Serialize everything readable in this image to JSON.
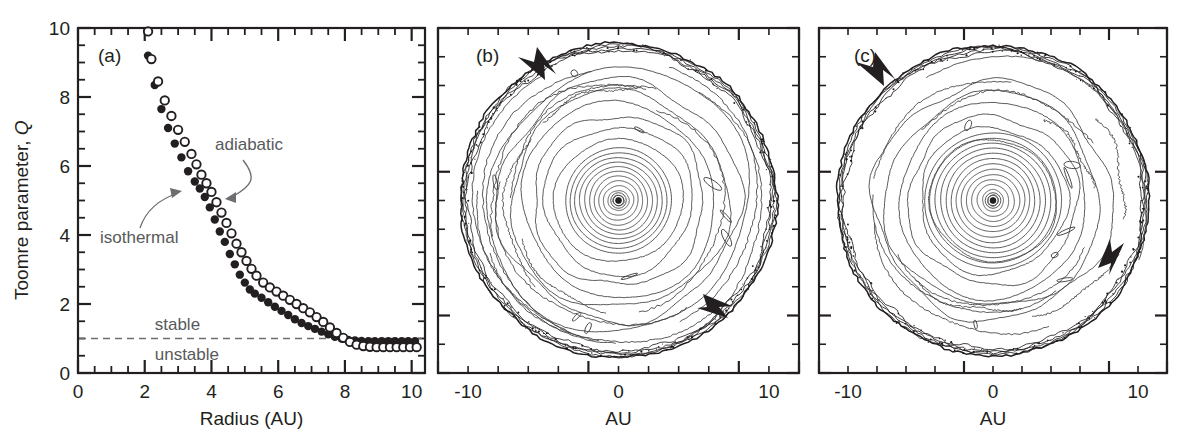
{
  "figure": {
    "background": "#ffffff",
    "ink": "#231f20",
    "annotation_color": "#58595b"
  },
  "panel_a": {
    "label": "(a)",
    "xlabel": "Radius (AU)",
    "ylabel_main": "Toomre parameter, ",
    "ylabel_symbol": "Q",
    "xticklabels": [
      "0",
      "2",
      "4",
      "6",
      "8",
      "10"
    ],
    "yticklabels": [
      "0",
      "2",
      "4",
      "6",
      "8",
      "10"
    ],
    "annotations": [
      {
        "name": "adiabatic",
        "text": "adiabatic"
      },
      {
        "name": "isothermal",
        "text": "isothermal"
      }
    ],
    "region_labels": [
      {
        "name": "stable",
        "text": "stable"
      },
      {
        "name": "unstable",
        "text": "unstable"
      }
    ],
    "threshold_label_value": "1"
  },
  "panel_b": {
    "label": "(b)",
    "xlabel": "AU",
    "xticklabels": [
      "-10",
      "0",
      "10"
    ]
  },
  "panel_c": {
    "label": "(c)",
    "xlabel": "AU",
    "xticklabels": [
      "-10",
      "0",
      "10"
    ]
  },
  "chart_data": [
    {
      "type": "scatter",
      "id": "panel-a",
      "title": "(a)",
      "xlabel": "Radius (AU)",
      "ylabel": "Toomre parameter, Q",
      "xlim": [
        0,
        10.4
      ],
      "ylim": [
        0,
        10
      ],
      "xticks": [
        0,
        2,
        4,
        6,
        8,
        10
      ],
      "yticks": [
        0,
        2,
        4,
        6,
        8,
        10
      ],
      "xminortick_step": 0.5,
      "yminortick_step": 0.5,
      "grid": false,
      "legend": "inline-annotations",
      "annotations": [
        {
          "text": "adiabatic",
          "points_to_series": "adiabatic",
          "x": 5.6,
          "y": 6.6
        },
        {
          "text": "isothermal",
          "points_to_series": "isothermal",
          "x": 2.3,
          "y": 3.95
        },
        {
          "text": "stable",
          "x": 4.0,
          "y": 1.35
        },
        {
          "text": "unstable",
          "x": 4.0,
          "y": 0.62
        }
      ],
      "reference_lines": [
        {
          "orientation": "horizontal",
          "y": 1.0,
          "style": "dashed",
          "meaning": "Q = 1 stability threshold"
        }
      ],
      "series": [
        {
          "name": "isothermal",
          "marker": "filled-circle",
          "x": [
            2.1,
            2.3,
            2.5,
            2.7,
            2.9,
            3.1,
            3.3,
            3.5,
            3.65,
            3.8,
            3.95,
            4.1,
            4.25,
            4.4,
            4.55,
            4.7,
            4.85,
            5.0,
            5.15,
            5.3,
            5.5,
            5.7,
            5.9,
            6.1,
            6.3,
            6.5,
            6.7,
            6.9,
            7.1,
            7.3,
            7.5,
            7.7,
            7.9,
            8.1,
            8.3,
            8.5,
            8.7,
            8.9,
            9.1,
            9.3,
            9.5,
            9.7,
            9.9,
            10.1
          ],
          "y": [
            9.2,
            8.35,
            7.65,
            7.1,
            6.65,
            6.25,
            5.85,
            5.55,
            5.35,
            5.1,
            4.8,
            4.45,
            4.1,
            3.8,
            3.45,
            3.15,
            2.85,
            2.62,
            2.42,
            2.3,
            2.18,
            2.05,
            1.92,
            1.8,
            1.68,
            1.56,
            1.45,
            1.36,
            1.28,
            1.2,
            1.12,
            1.05,
            1.0,
            0.96,
            0.94,
            0.93,
            0.92,
            0.92,
            0.92,
            0.92,
            0.92,
            0.92,
            0.92,
            0.92
          ]
        },
        {
          "name": "adiabatic",
          "marker": "open-circle",
          "x": [
            2.2,
            2.4,
            2.6,
            2.8,
            3.0,
            3.2,
            3.4,
            3.55,
            3.7,
            3.85,
            4.0,
            4.15,
            4.3,
            4.45,
            4.6,
            4.75,
            4.9,
            5.05,
            5.2,
            5.35,
            5.55,
            5.75,
            5.95,
            6.15,
            6.35,
            6.55,
            6.75,
            6.95,
            7.15,
            7.35,
            7.55,
            7.75,
            7.95,
            8.15,
            8.35,
            8.55,
            8.75,
            8.95,
            9.15,
            9.35,
            9.55,
            9.75,
            9.95,
            10.15,
            2.1
          ],
          "y": [
            9.1,
            8.45,
            7.9,
            7.45,
            7.05,
            6.7,
            6.35,
            6.05,
            5.75,
            5.5,
            5.25,
            4.95,
            4.65,
            4.35,
            4.05,
            3.75,
            3.5,
            3.25,
            3.02,
            2.82,
            2.62,
            2.48,
            2.36,
            2.24,
            2.12,
            2.0,
            1.88,
            1.76,
            1.62,
            1.48,
            1.32,
            1.16,
            1.02,
            0.9,
            0.82,
            0.78,
            0.76,
            0.75,
            0.75,
            0.75,
            0.75,
            0.75,
            0.75,
            0.75,
            9.9
          ]
        }
      ]
    },
    {
      "type": "contour",
      "id": "panel-b",
      "title": "(b)",
      "xlabel": "AU",
      "ylabel": "",
      "xlim": [
        -11.5,
        11.5
      ],
      "ylim": [
        -11.5,
        11.5
      ],
      "xticks": [
        -10,
        0,
        10
      ],
      "xminortick_step": 2,
      "grid": false,
      "description": "Face-on log surface-density contour map of a gravitationally unstable protoplanetary disk; concentric inner rings plus outer spiral-arm filaments, disk edge near 11 AU",
      "annotations": [
        {
          "type": "arrow",
          "name": "rotation-arrow-upper-left",
          "x": -5.0,
          "y": 7.4,
          "direction": "down-left"
        },
        {
          "type": "arrow",
          "name": "rotation-arrow-lower-right",
          "x": 4.0,
          "y": -7.3,
          "direction": "down-right"
        }
      ],
      "central_marker": {
        "x": 0,
        "y": 0,
        "style": "filled-dot",
        "meaning": "central star"
      }
    },
    {
      "type": "contour",
      "id": "panel-c",
      "title": "(c)",
      "xlabel": "AU",
      "ylabel": "",
      "xlim": [
        -11.5,
        11.5
      ],
      "ylim": [
        -11.5,
        11.5
      ],
      "xticks": [
        -10,
        0,
        10
      ],
      "xminortick_step": 2,
      "grid": false,
      "description": "Face-on log surface-density contour map at a later time; tighter inner rings and a strong spiral/clump feature at lower right",
      "annotations": [
        {
          "type": "arrow",
          "name": "rotation-arrow-upper-left",
          "x": -7.0,
          "y": 7.0,
          "direction": "down-left"
        },
        {
          "type": "arrow",
          "name": "rotation-arrow-lower-right",
          "x": 7.2,
          "y": -4.0,
          "direction": "up-right"
        }
      ],
      "central_marker": {
        "x": 0,
        "y": 0,
        "style": "filled-dot",
        "meaning": "central star"
      }
    }
  ]
}
